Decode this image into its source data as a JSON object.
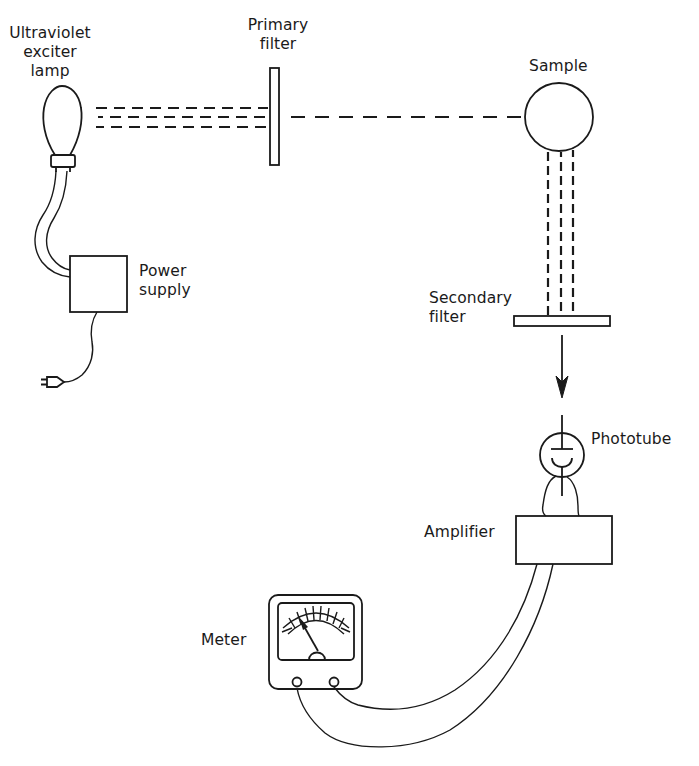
{
  "diagram": {
    "components": {
      "lamp": {
        "label_line1": "Ultraviolet",
        "label_line2": "exciter",
        "label_line3": "lamp"
      },
      "power_supply": {
        "label_line1": "Power",
        "label_line2": "supply"
      },
      "primary_filter": {
        "label_line1": "Primary",
        "label_line2": "filter"
      },
      "sample": {
        "label": "Sample"
      },
      "secondary_filter": {
        "label_line1": "Secondary",
        "label_line2": "filter"
      },
      "phototube": {
        "label": "Phototube"
      },
      "amplifier": {
        "label": "Amplifier"
      },
      "meter": {
        "label": "Meter"
      }
    },
    "connections": [
      "lamp -> primary filter (3 dashed beams)",
      "primary filter -> sample (1 dashed beam)",
      "sample -> secondary filter (3 dashed vertical beams)",
      "secondary filter -> phototube (arrow)",
      "phototube -> amplifier",
      "amplifier -> meter (cable)",
      "lamp -> power supply (cable)",
      "power supply -> wall plug"
    ],
    "colors": {
      "ink": "#1a1a1a",
      "background": "#ffffff"
    }
  }
}
